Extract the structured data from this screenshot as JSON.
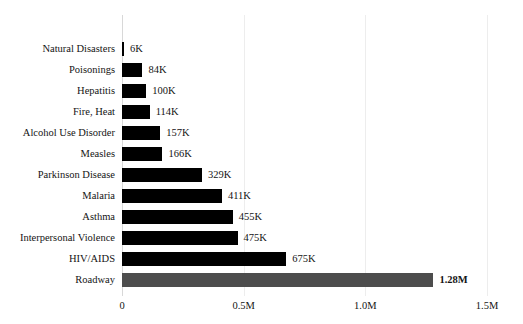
{
  "chart_data": {
    "type": "bar",
    "orientation": "horizontal",
    "title": "",
    "subtitle": "",
    "xlabel": "",
    "ylabel": "",
    "xlim": [
      0,
      1500000
    ],
    "grid": true,
    "legend": false,
    "tick_labels": [
      "0",
      "0.5M",
      "1.0M",
      "1.5M"
    ],
    "tick_values": [
      0,
      500000,
      1000000,
      1500000
    ],
    "categories": [
      "Natural Disasters",
      "Poisonings",
      "Hepatitis",
      "Fire, Heat",
      "Alcohol Use Disorder",
      "Measles",
      "Parkinson Disease",
      "Malaria",
      "Asthma",
      "Interpersonal Violence",
      "HIV/AIDS",
      "Roadway"
    ],
    "values": [
      6000,
      84000,
      100000,
      114000,
      157000,
      166000,
      329000,
      411000,
      455000,
      475000,
      675000,
      1280000
    ],
    "value_labels": [
      "6K",
      "84K",
      "100K",
      "114K",
      "157K",
      "166K",
      "329K",
      "411K",
      "455K",
      "475K",
      "675K",
      "1.28M"
    ],
    "bar_colors": [
      "#000000",
      "#000000",
      "#000000",
      "#000000",
      "#000000",
      "#000000",
      "#000000",
      "#000000",
      "#000000",
      "#000000",
      "#000000",
      "#4d4d4d"
    ],
    "highlight_index": 11,
    "highlight_color": "#4d4d4d",
    "bar_color": "#000000",
    "grid_color": "#ededed",
    "background_color": "#ffffff"
  }
}
